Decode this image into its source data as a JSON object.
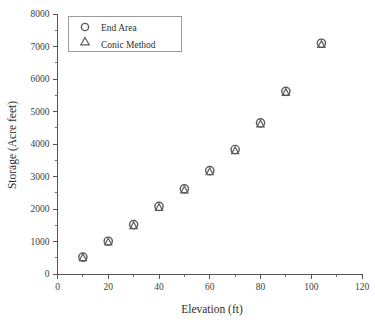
{
  "chart_data": {
    "type": "scatter",
    "title": "",
    "xlabel": "Elevation (ft)",
    "ylabel": "Storage (Acre feet)",
    "xlim": [
      0,
      120
    ],
    "ylim": [
      0,
      8000
    ],
    "xticks": [
      0,
      20,
      40,
      60,
      80,
      100,
      120
    ],
    "yticks": [
      0,
      1000,
      2000,
      3000,
      4000,
      5000,
      6000,
      7000,
      8000
    ],
    "xtick_labels": [
      "0",
      "20",
      "40",
      "60",
      "80",
      "100",
      "120"
    ],
    "ytick_labels": [
      "0",
      "1000",
      "2000",
      "3000",
      "4000",
      "5000",
      "6000",
      "7000",
      "8000"
    ],
    "x_minor_step": 10,
    "y_minor_step": 500,
    "grid": false,
    "legend_position": "upper left",
    "series": [
      {
        "name": "End Area",
        "marker": "circle",
        "x": [
          10,
          20,
          30,
          40,
          50,
          60,
          70,
          80,
          90,
          104
        ],
        "y": [
          520,
          1010,
          1520,
          2080,
          2620,
          3180,
          3830,
          4650,
          5620,
          7100
        ]
      },
      {
        "name": "Conic Method",
        "marker": "triangle",
        "x": [
          10,
          20,
          30,
          40,
          50,
          60,
          70,
          80,
          90,
          104
        ],
        "y": [
          500,
          980,
          1480,
          2040,
          2580,
          3140,
          3790,
          4610,
          5580,
          7060
        ]
      }
    ],
    "colors": {
      "marker_stroke": "#5a5a5a",
      "axis": "#555555",
      "text": "#2e2e2e",
      "background": "#ffffff"
    }
  },
  "legend": {
    "entries": [
      {
        "label": "End Area",
        "marker": "circle-marker"
      },
      {
        "label": "Conic Method",
        "marker": "triangle-marker"
      }
    ]
  }
}
